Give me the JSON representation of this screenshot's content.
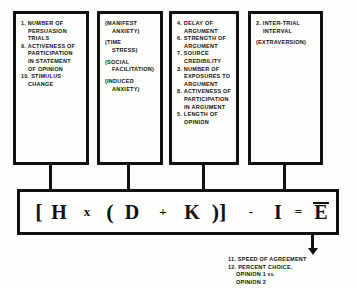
{
  "diagram": {
    "colors": {
      "ink": "#111111",
      "background": "#fdfdfb"
    },
    "boxes": [
      {
        "id": "box-h",
        "target_symbol": "H",
        "lines": [
          {
            "text": "1. NUMBER OF",
            "indent": 0,
            "gap": false
          },
          {
            "text": "PERSUASION",
            "indent": 1,
            "gap": false
          },
          {
            "text": "TRIALS",
            "indent": 1,
            "gap": false
          },
          {
            "text": "9. ACTIVENESS OF",
            "indent": 0,
            "gap": false
          },
          {
            "text": "PARTICIPATION",
            "indent": 1,
            "gap": false
          },
          {
            "text": "IN STATEMENT",
            "indent": 1,
            "gap": false
          },
          {
            "text": "OF OPINION",
            "indent": 1,
            "gap": false
          },
          {
            "text": "10. STIMULUS",
            "indent": 0,
            "gap": false
          },
          {
            "text": "CHANGE",
            "indent": 1,
            "gap": false
          }
        ]
      },
      {
        "id": "box-d",
        "target_symbol": "D",
        "lines": [
          {
            "text": "(MANIFEST",
            "indent": 0,
            "gap": false
          },
          {
            "text": "ANXIETY)",
            "indent": 1,
            "gap": false
          },
          {
            "text": "(TIME",
            "indent": 0,
            "gap": true
          },
          {
            "text": "STRESS)",
            "indent": 1,
            "gap": false
          },
          {
            "text": "(SOCIAL",
            "indent": 0,
            "gap": true
          },
          {
            "text": "FACILITATION)",
            "indent": 1,
            "gap": false
          },
          {
            "text": "(INDUCED",
            "indent": 0,
            "gap": true
          },
          {
            "text": "ANXIETY)",
            "indent": 1,
            "gap": false
          }
        ]
      },
      {
        "id": "box-k",
        "target_symbol": "K",
        "lines": [
          {
            "text": "4. DELAY OF",
            "indent": 0,
            "gap": false
          },
          {
            "text": "ARGUMENT",
            "indent": 1,
            "gap": false
          },
          {
            "text": "6. STRENGTH OF",
            "indent": 0,
            "gap": false
          },
          {
            "text": "ARGUMENT",
            "indent": 1,
            "gap": false
          },
          {
            "text": "7. SOURCE",
            "indent": 0,
            "gap": false
          },
          {
            "text": "CREDIBILITY",
            "indent": 1,
            "gap": false
          },
          {
            "text": "3. NUMBER OF",
            "indent": 0,
            "gap": false
          },
          {
            "text": "EXPOSURES TO",
            "indent": 1,
            "gap": false
          },
          {
            "text": "ARGUMENT",
            "indent": 1,
            "gap": false
          },
          {
            "text": "8. ACTIVENESS OF",
            "indent": 0,
            "gap": false
          },
          {
            "text": "PARTICIPATION",
            "indent": 1,
            "gap": false
          },
          {
            "text": "IN ARGUMENT",
            "indent": 1,
            "gap": false
          },
          {
            "text": "5. LENGTH OF",
            "indent": 0,
            "gap": false
          },
          {
            "text": "OPINION",
            "indent": 1,
            "gap": false
          }
        ]
      },
      {
        "id": "box-i",
        "target_symbol": "I",
        "lines": [
          {
            "text": "2. INTER-TRIAL",
            "indent": 0,
            "gap": false
          },
          {
            "text": "INTERVAL",
            "indent": 1,
            "gap": false
          },
          {
            "text": "(EXTRAVERSION)",
            "indent": 0,
            "gap": true
          }
        ]
      }
    ],
    "formula": {
      "full_text": "[H x (D + K)] - I = E̅",
      "tokens": [
        {
          "glyph": "[",
          "kind": "bracket",
          "overbar": false
        },
        {
          "glyph": "H",
          "kind": "letter",
          "overbar": false
        },
        {
          "glyph": "x",
          "kind": "small",
          "overbar": false
        },
        {
          "glyph": "(",
          "kind": "bracket",
          "overbar": false
        },
        {
          "glyph": "D",
          "kind": "letter",
          "overbar": false
        },
        {
          "glyph": "+",
          "kind": "small",
          "overbar": false
        },
        {
          "glyph": "K",
          "kind": "letter",
          "overbar": false
        },
        {
          "glyph": ")]",
          "kind": "bracket",
          "overbar": false
        },
        {
          "glyph": "-",
          "kind": "small",
          "overbar": false
        },
        {
          "glyph": "I",
          "kind": "letter",
          "overbar": false
        },
        {
          "glyph": "=",
          "kind": "eq",
          "overbar": false
        },
        {
          "glyph": "E",
          "kind": "letter",
          "overbar": true
        }
      ]
    },
    "outputs": {
      "lines": [
        {
          "text": "11. SPEED OF AGREEMENT",
          "indent": 0
        },
        {
          "text": "12. PERCENT CHOICE,",
          "indent": 0
        },
        {
          "text": "OPINION 1 vs.",
          "indent": 1
        },
        {
          "text": "OPINION 2",
          "indent": 1
        }
      ]
    }
  }
}
